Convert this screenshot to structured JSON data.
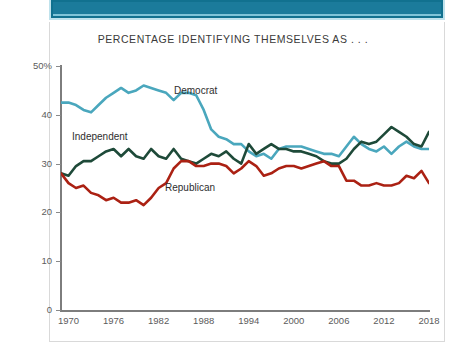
{
  "banner": {
    "name": "top-teal-banner",
    "color": "#1b7b9b"
  },
  "chart_data": {
    "type": "line",
    "title": "PERCENTAGE IDENTIFYING THEMSELVES AS . . .",
    "xlabel": "",
    "ylabel": "",
    "xlim": [
      1969,
      2018
    ],
    "ylim": [
      0,
      50
    ],
    "grid": false,
    "legend": "inline-labels",
    "ytick_labels": [
      "50%",
      "40",
      "30",
      "20",
      "10",
      "0"
    ],
    "ytick_values": [
      50,
      40,
      30,
      20,
      10,
      0
    ],
    "xtick_labels": [
      "1970",
      "1976",
      "1982",
      "1988",
      "1994",
      "2000",
      "2006",
      "2012",
      "2018"
    ],
    "xtick_values": [
      1970,
      1976,
      1982,
      1988,
      1994,
      2000,
      2006,
      2012,
      2018
    ],
    "x": [
      1969,
      1970,
      1971,
      1972,
      1973,
      1974,
      1975,
      1976,
      1977,
      1978,
      1979,
      1980,
      1981,
      1982,
      1983,
      1984,
      1985,
      1986,
      1987,
      1988,
      1989,
      1990,
      1991,
      1992,
      1993,
      1994,
      1995,
      1996,
      1997,
      1998,
      1999,
      2000,
      2001,
      2002,
      2003,
      2004,
      2005,
      2006,
      2007,
      2008,
      2009,
      2010,
      2011,
      2012,
      2013,
      2014,
      2015,
      2016,
      2017,
      2018
    ],
    "series": [
      {
        "name": "Democrat",
        "color": "#4aa7bd",
        "label": "Democrat",
        "values": [
          42.5,
          42.5,
          42.0,
          41.0,
          40.5,
          42.0,
          43.5,
          44.5,
          45.5,
          44.5,
          45.0,
          46.0,
          45.5,
          45.0,
          44.5,
          43.0,
          44.5,
          44.5,
          44.0,
          41.0,
          37.0,
          35.5,
          35.0,
          34.0,
          34.0,
          32.5,
          31.5,
          32.0,
          31.0,
          33.0,
          33.5,
          33.5,
          33.5,
          33.0,
          32.5,
          32.0,
          32.0,
          31.5,
          33.5,
          35.5,
          34.0,
          33.0,
          32.5,
          33.5,
          32.0,
          33.5,
          34.5,
          33.5,
          33.0,
          33.0
        ]
      },
      {
        "name": "Independent",
        "color": "#1e4a39",
        "label": "Independent",
        "values": [
          28.0,
          27.5,
          29.5,
          30.5,
          30.5,
          31.5,
          32.5,
          33.0,
          31.5,
          33.0,
          31.5,
          31.0,
          33.0,
          31.5,
          31.0,
          33.0,
          31.0,
          30.5,
          30.0,
          31.0,
          32.0,
          31.5,
          32.5,
          31.0,
          30.0,
          34.0,
          32.0,
          33.0,
          34.0,
          33.0,
          33.0,
          32.5,
          32.5,
          32.0,
          31.5,
          30.5,
          30.0,
          30.0,
          31.0,
          33.0,
          34.5,
          34.0,
          34.5,
          36.0,
          37.5,
          36.5,
          35.5,
          34.0,
          33.5,
          36.5
        ]
      },
      {
        "name": "Republican",
        "color": "#ab2113",
        "label": "Republican",
        "values": [
          28.0,
          26.0,
          25.0,
          25.5,
          24.0,
          23.5,
          22.5,
          23.0,
          22.0,
          22.0,
          22.5,
          21.5,
          23.0,
          25.0,
          26.0,
          29.0,
          30.5,
          30.5,
          29.5,
          29.5,
          30.0,
          30.0,
          29.5,
          28.0,
          29.0,
          30.5,
          29.5,
          27.5,
          28.0,
          29.0,
          29.5,
          29.5,
          29.0,
          29.5,
          30.0,
          30.5,
          29.5,
          29.5,
          26.5,
          26.5,
          25.5,
          25.5,
          26.0,
          25.5,
          25.5,
          26.0,
          27.5,
          27.0,
          28.5,
          26.0
        ]
      }
    ]
  }
}
